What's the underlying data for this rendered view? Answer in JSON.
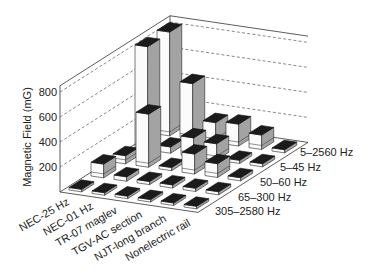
{
  "chart_data": {
    "type": "bar",
    "subtype": "3d-bar",
    "title": "",
    "xlabel": "",
    "ylabel": "Magnetic Field (mG)",
    "yticks": [
      200,
      400,
      600,
      800
    ],
    "ylim": [
      0,
      850
    ],
    "grid": true,
    "legend": null,
    "categories": [
      "NEC-25 Hz",
      "NEC-01 Hz",
      "TR-07 maglev",
      "TGV-AC section",
      "NJT-long branch",
      "Nonelectric rail"
    ],
    "series": [
      {
        "name": "5–2560 Hz",
        "values": [
          830,
          445,
          160,
          175,
          115,
          25
        ]
      },
      {
        "name": "5–45 Hz",
        "values": [
          825,
          50,
          150,
          130,
          25,
          25
        ]
      },
      {
        "name": "50–60 Hz",
        "values": [
          65,
          425,
          25,
          160,
          110,
          25
        ]
      },
      {
        "name": "65–300 Hz",
        "values": [
          110,
          35,
          25,
          25,
          25,
          25
        ]
      },
      {
        "name": "305–2580 Hz",
        "values": [
          20,
          20,
          20,
          20,
          20,
          20
        ]
      }
    ],
    "colors": {
      "bar_front": "#fbfbfb",
      "bar_side": "#a3a3a3",
      "bar_top": "#1b1b1b",
      "grid": "#555555"
    }
  }
}
